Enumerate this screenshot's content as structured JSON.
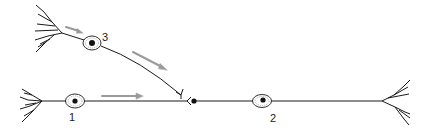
{
  "diagram": {
    "type": "neuron-circuit",
    "neurons": [
      {
        "id": "1",
        "label": "1",
        "role": "presynaptic neuron"
      },
      {
        "id": "2",
        "label": "2",
        "role": "postsynaptic neuron"
      },
      {
        "id": "3",
        "label": "3",
        "role": "modulatory neuron (axo-axonic synapse)"
      }
    ],
    "connections": [
      {
        "from": "3",
        "to": "1-terminal",
        "type": "axo-axonic synapse"
      },
      {
        "from": "1",
        "to": "2",
        "type": "axo-dendritic synapse"
      }
    ],
    "arrows": [
      {
        "near": "3",
        "meaning": "signal direction"
      },
      {
        "near": "3-axon",
        "meaning": "signal direction"
      },
      {
        "near": "1-axon",
        "meaning": "signal direction"
      }
    ],
    "colors": {
      "line": "#1a1a1a",
      "arrow": "#9a9a9a",
      "nucleus": "#111111"
    }
  }
}
